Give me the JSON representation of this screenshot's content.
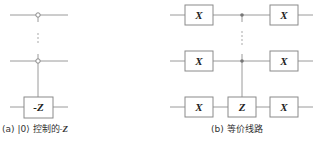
{
  "figure_a": {
    "gate_label": "-Z",
    "caption_prefix": "(a) |0⟩ 控制的",
    "caption_math": "-Z",
    "ellipsis": "⋮"
  },
  "figure_b": {
    "gates_left": [
      "X",
      "X",
      "X"
    ],
    "gate_center": "Z",
    "gates_right": [
      "X",
      "X",
      "X"
    ],
    "caption": "(b) 等价线路",
    "ellipsis": "⋮"
  },
  "colors": {
    "wire": "#9a9a9a",
    "gate_border": "#8a8a8a",
    "control_dot": "#777777"
  }
}
